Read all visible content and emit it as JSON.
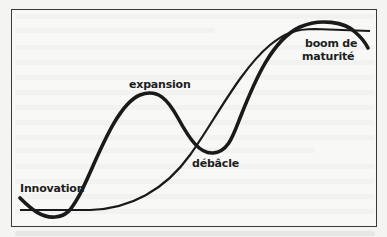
{
  "diagram": {
    "type": "cycle-curves",
    "labels": {
      "innovation": "Innovation",
      "expansion": "expansion",
      "debacle": "débâcle",
      "boom_line1": "boom de",
      "boom_line2": "maturité"
    },
    "colors": {
      "curve": "#1a1a1a",
      "frame": "#3a3a3a",
      "background": "#f4f4f2"
    }
  }
}
